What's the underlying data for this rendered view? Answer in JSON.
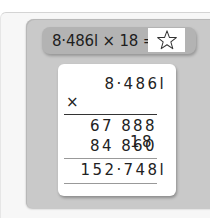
{
  "problem": {
    "expression": "8·486l × 18 =",
    "answer_placeholder_icon": "star-icon"
  },
  "calculation": {
    "multiplicand": "8·486l",
    "operator": "×",
    "multiplier": "18",
    "partial_products": [
      "67 888",
      "84 860"
    ],
    "result": "152·748l"
  },
  "colors": {
    "panel": "#c9c9c9",
    "pill": "#b3b3b3",
    "card": "#ffffff",
    "text": "#222222"
  }
}
